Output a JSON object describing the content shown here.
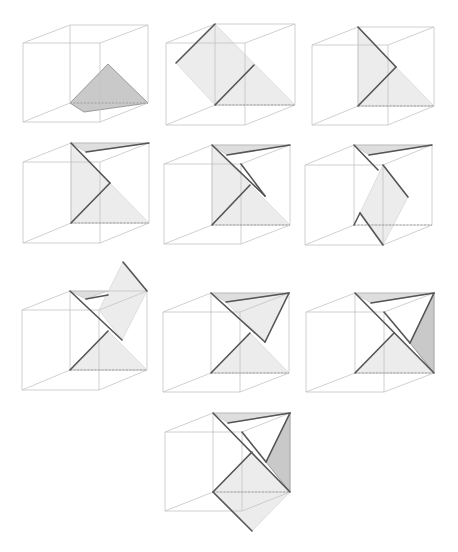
{
  "colors": {
    "edge": "#c4c4c4",
    "fold_line": "#555555",
    "shaded_face": "#c9c9c9",
    "light_face": "#ececec",
    "top_face": "#dedede",
    "dashed": "#9a9a9a"
  },
  "panels": [
    {
      "id": "step-1",
      "ox": 0,
      "oy": 0,
      "cube": {
        "front": [
          [
            23,
            43
          ],
          [
            100,
            43
          ],
          [
            100,
            122
          ],
          [
            23,
            122
          ]
        ],
        "back": [
          [
            70,
            25
          ],
          [
            148,
            25
          ],
          [
            148,
            103
          ],
          [
            70,
            103
          ]
        ]
      },
      "faces_dark": [
        [
          [
            70,
            103
          ],
          [
            108,
            64
          ],
          [
            148,
            103
          ],
          [
            84,
            112
          ]
        ]
      ],
      "faces_light": [],
      "faces_top": [],
      "folds": [],
      "dashed": [
        [
          [
            70,
            103
          ],
          [
            148,
            103
          ]
        ]
      ]
    },
    {
      "id": "step-2",
      "ox": 150,
      "oy": 0,
      "cube": {
        "front": [
          [
            16,
            43
          ],
          [
            95,
            43
          ],
          [
            95,
            125
          ],
          [
            16,
            125
          ]
        ],
        "back": [
          [
            65,
            24
          ],
          [
            145,
            24
          ],
          [
            145,
            105
          ],
          [
            65,
            105
          ]
        ]
      },
      "faces_dark": [],
      "faces_light": [
        [
          [
            26,
            63
          ],
          [
            65,
            24
          ],
          [
            145,
            105
          ],
          [
            65,
            105
          ],
          [
            26,
            63
          ]
        ]
      ],
      "faces_top": [],
      "folds": [
        [
          [
            26,
            63
          ],
          [
            65,
            24
          ]
        ],
        [
          [
            65,
            105
          ],
          [
            104,
            65
          ]
        ]
      ],
      "dashed": [
        [
          [
            65,
            105
          ],
          [
            145,
            105
          ]
        ]
      ]
    },
    {
      "id": "step-3",
      "ox": 300,
      "oy": 0,
      "cube": {
        "front": [
          [
            12,
            45
          ],
          [
            88,
            45
          ],
          [
            88,
            125
          ],
          [
            12,
            125
          ]
        ],
        "back": [
          [
            58,
            27
          ],
          [
            134,
            27
          ],
          [
            134,
            106
          ],
          [
            58,
            106
          ]
        ]
      },
      "faces_dark": [],
      "faces_light": [
        [
          [
            58,
            27
          ],
          [
            96,
            67
          ],
          [
            134,
            106
          ],
          [
            58,
            106
          ]
        ]
      ],
      "faces_top": [],
      "folds": [
        [
          [
            58,
            27
          ],
          [
            96,
            67
          ]
        ],
        [
          [
            96,
            67
          ],
          [
            58,
            106
          ]
        ]
      ],
      "dashed": [
        [
          [
            58,
            106
          ],
          [
            134,
            106
          ]
        ]
      ]
    },
    {
      "id": "step-4",
      "ox": 0,
      "oy": 130,
      "cube": {
        "front": [
          [
            23,
            32
          ],
          [
            100,
            32
          ],
          [
            100,
            113
          ],
          [
            23,
            113
          ]
        ],
        "back": [
          [
            71,
            13
          ],
          [
            149,
            13
          ],
          [
            149,
            93
          ],
          [
            71,
            93
          ]
        ]
      },
      "faces_dark": [],
      "faces_light": [
        [
          [
            71,
            13
          ],
          [
            110,
            53
          ],
          [
            149,
            93
          ],
          [
            71,
            93
          ]
        ]
      ],
      "faces_top": [
        [
          [
            71,
            13
          ],
          [
            149,
            13
          ],
          [
            86,
            22
          ]
        ]
      ],
      "folds": [
        [
          [
            71,
            13
          ],
          [
            110,
            53
          ]
        ],
        [
          [
            110,
            53
          ],
          [
            71,
            93
          ]
        ],
        [
          [
            86,
            22
          ],
          [
            149,
            13
          ]
        ]
      ],
      "dashed": [
        [
          [
            71,
            93
          ],
          [
            149,
            93
          ]
        ]
      ]
    },
    {
      "id": "step-5",
      "ox": 150,
      "oy": 130,
      "cube": {
        "front": [
          [
            14,
            34
          ],
          [
            91,
            34
          ],
          [
            91,
            114
          ],
          [
            14,
            114
          ]
        ],
        "back": [
          [
            62,
            15
          ],
          [
            140,
            15
          ],
          [
            140,
            95
          ],
          [
            62,
            95
          ]
        ]
      },
      "faces_dark": [],
      "faces_light": [
        [
          [
            62,
            15
          ],
          [
            100,
            55
          ],
          [
            140,
            95
          ],
          [
            62,
            95
          ]
        ]
      ],
      "faces_top": [
        [
          [
            62,
            15
          ],
          [
            140,
            15
          ],
          [
            77,
            25
          ]
        ]
      ],
      "folds": [
        [
          [
            62,
            15
          ],
          [
            115,
            66
          ]
        ],
        [
          [
            91,
            34
          ],
          [
            115,
            66
          ]
        ],
        [
          [
            100,
            55
          ],
          [
            62,
            95
          ]
        ],
        [
          [
            77,
            25
          ],
          [
            140,
            15
          ]
        ]
      ],
      "dashed": [
        [
          [
            62,
            95
          ],
          [
            140,
            95
          ]
        ]
      ]
    },
    {
      "id": "step-6",
      "ox": 300,
      "oy": 130,
      "cube": {
        "front": [
          [
            5,
            35
          ],
          [
            83,
            35
          ],
          [
            83,
            115
          ],
          [
            5,
            115
          ]
        ],
        "back": [
          [
            54,
            15
          ],
          [
            132,
            15
          ],
          [
            132,
            95
          ],
          [
            54,
            95
          ]
        ]
      },
      "faces_dark": [],
      "faces_light": [
        [
          [
            83,
            35
          ],
          [
            108,
            67
          ],
          [
            83,
            115
          ],
          [
            60,
            83
          ]
        ]
      ],
      "faces_top": [
        [
          [
            54,
            15
          ],
          [
            132,
            15
          ],
          [
            69,
            25
          ]
        ]
      ],
      "folds": [
        [
          [
            54,
            15
          ],
          [
            78,
            40
          ]
        ],
        [
          [
            83,
            35
          ],
          [
            108,
            67
          ]
        ],
        [
          [
            60,
            83
          ],
          [
            83,
            115
          ]
        ],
        [
          [
            54,
            95
          ],
          [
            60,
            83
          ]
        ],
        [
          [
            69,
            25
          ],
          [
            132,
            15
          ]
        ]
      ],
      "dashed": [
        [
          [
            54,
            95
          ],
          [
            132,
            95
          ]
        ]
      ]
    },
    {
      "id": "step-7",
      "ox": 0,
      "oy": 255,
      "cube": {
        "front": [
          [
            22,
            55
          ],
          [
            99,
            55
          ],
          [
            99,
            135
          ],
          [
            22,
            135
          ]
        ],
        "back": [
          [
            70,
            36
          ],
          [
            147,
            36
          ],
          [
            147,
            115
          ],
          [
            70,
            115
          ]
        ]
      },
      "faces_dark": [],
      "faces_light": [
        [
          [
            99,
            55
          ],
          [
            123,
            7
          ],
          [
            147,
            36
          ],
          [
            122,
            85
          ]
        ],
        [
          [
            70,
            115
          ],
          [
            108,
            76
          ],
          [
            147,
            115
          ]
        ]
      ],
      "faces_top": [
        [
          [
            70,
            36
          ],
          [
            108,
            36
          ],
          [
            86,
            44
          ]
        ]
      ],
      "folds": [
        [
          [
            70,
            36
          ],
          [
            122,
            85
          ]
        ],
        [
          [
            123,
            7
          ],
          [
            147,
            36
          ]
        ],
        [
          [
            108,
            76
          ],
          [
            70,
            115
          ]
        ],
        [
          [
            86,
            44
          ],
          [
            108,
            40
          ]
        ]
      ],
      "dashed": [
        [
          [
            70,
            115
          ],
          [
            147,
            115
          ]
        ]
      ]
    },
    {
      "id": "step-8",
      "ox": 150,
      "oy": 260,
      "cube": {
        "front": [
          [
            13,
            52
          ],
          [
            90,
            52
          ],
          [
            90,
            132
          ],
          [
            13,
            132
          ]
        ],
        "back": [
          [
            61,
            33
          ],
          [
            139,
            33
          ],
          [
            139,
            113
          ],
          [
            61,
            113
          ]
        ]
      },
      "faces_dark": [],
      "faces_light": [
        [
          [
            61,
            113
          ],
          [
            100,
            73
          ],
          [
            139,
            113
          ]
        ],
        [
          [
            76,
            42
          ],
          [
            139,
            33
          ],
          [
            115,
            82
          ]
        ]
      ],
      "faces_top": [
        [
          [
            61,
            33
          ],
          [
            139,
            33
          ],
          [
            76,
            42
          ]
        ]
      ],
      "folds": [
        [
          [
            61,
            33
          ],
          [
            115,
            82
          ]
        ],
        [
          [
            76,
            42
          ],
          [
            139,
            33
          ]
        ],
        [
          [
            139,
            33
          ],
          [
            115,
            82
          ]
        ],
        [
          [
            100,
            73
          ],
          [
            61,
            113
          ]
        ]
      ],
      "dashed": [
        [
          [
            61,
            113
          ],
          [
            139,
            113
          ]
        ]
      ]
    },
    {
      "id": "step-9",
      "ox": 300,
      "oy": 260,
      "cube": {
        "front": [
          [
            6,
            52
          ],
          [
            84,
            52
          ],
          [
            84,
            132
          ],
          [
            6,
            132
          ]
        ],
        "back": [
          [
            55,
            33
          ],
          [
            134,
            33
          ],
          [
            134,
            113
          ],
          [
            55,
            113
          ]
        ]
      },
      "faces_dark": [
        [
          [
            134,
            33
          ],
          [
            134,
            113
          ],
          [
            110,
            83
          ]
        ]
      ],
      "faces_light": [
        [
          [
            55,
            113
          ],
          [
            94,
            73
          ],
          [
            134,
            113
          ]
        ]
      ],
      "faces_top": [
        [
          [
            55,
            33
          ],
          [
            134,
            33
          ],
          [
            71,
            43
          ]
        ]
      ],
      "folds": [
        [
          [
            55,
            33
          ],
          [
            134,
            113
          ]
        ],
        [
          [
            71,
            43
          ],
          [
            134,
            33
          ]
        ],
        [
          [
            134,
            33
          ],
          [
            110,
            83
          ]
        ],
        [
          [
            94,
            73
          ],
          [
            55,
            113
          ]
        ],
        [
          [
            84,
            52
          ],
          [
            110,
            83
          ]
        ]
      ],
      "dashed": [
        [
          [
            55,
            113
          ],
          [
            134,
            113
          ]
        ]
      ]
    },
    {
      "id": "step-10",
      "ox": 150,
      "oy": 400,
      "cube": {
        "front": [
          [
            15,
            32
          ],
          [
            92,
            32
          ],
          [
            92,
            111
          ],
          [
            15,
            111
          ]
        ],
        "back": [
          [
            63,
            13
          ],
          [
            140,
            13
          ],
          [
            140,
            92
          ],
          [
            63,
            92
          ]
        ]
      },
      "faces_dark": [
        [
          [
            140,
            13
          ],
          [
            140,
            92
          ],
          [
            116,
            62
          ]
        ]
      ],
      "faces_light": [
        [
          [
            63,
            92
          ],
          [
            102,
            52
          ],
          [
            140,
            92
          ],
          [
            102,
            131
          ]
        ]
      ],
      "faces_top": [
        [
          [
            63,
            13
          ],
          [
            140,
            13
          ],
          [
            78,
            23
          ]
        ]
      ],
      "folds": [
        [
          [
            63,
            13
          ],
          [
            140,
            92
          ]
        ],
        [
          [
            78,
            23
          ],
          [
            140,
            13
          ]
        ],
        [
          [
            140,
            13
          ],
          [
            116,
            62
          ]
        ],
        [
          [
            102,
            52
          ],
          [
            63,
            92
          ]
        ],
        [
          [
            63,
            92
          ],
          [
            102,
            131
          ]
        ],
        [
          [
            92,
            32
          ],
          [
            116,
            62
          ]
        ]
      ],
      "dashed": [
        [
          [
            63,
            92
          ],
          [
            140,
            92
          ]
        ]
      ]
    }
  ]
}
